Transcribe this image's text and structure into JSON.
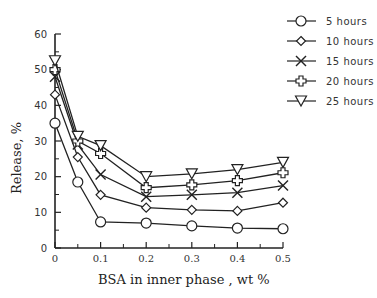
{
  "chart_data": {
    "type": "line",
    "title": "",
    "xlabel": "BSA  in inner phase , wt %",
    "ylabel": "Release,  %",
    "xlim": [
      0,
      0.5
    ],
    "ylim": [
      0,
      60
    ],
    "x_ticks": [
      0,
      0.1,
      0.2,
      0.3,
      0.4,
      0.5
    ],
    "x_tick_labels": [
      "0",
      "0.1",
      "0.2",
      "0.3",
      "0.4",
      "0.5"
    ],
    "y_ticks": [
      0,
      10,
      20,
      30,
      40,
      50,
      60
    ],
    "y_tick_labels": [
      "0",
      "10",
      "20",
      "30",
      "40",
      "50",
      "60"
    ],
    "grid": false,
    "legend_position": "upper right, outside plot",
    "x": [
      0,
      0.05,
      0.1,
      0.2,
      0.3,
      0.4,
      0.5
    ],
    "series": [
      {
        "name": "5 hours",
        "marker": "circle",
        "values": [
          35,
          18.5,
          7.3,
          7.0,
          6.2,
          5.6,
          5.4
        ]
      },
      {
        "name": "10 hours",
        "marker": "diamond",
        "values": [
          43,
          25.5,
          14.9,
          11.3,
          10.7,
          10.4,
          12.7
        ]
      },
      {
        "name": "15 hours",
        "marker": "cross",
        "values": [
          48,
          29,
          20.6,
          14.4,
          14.9,
          15.5,
          17.5
        ]
      },
      {
        "name": "20 hours",
        "marker": "plus",
        "values": [
          50,
          30,
          26.5,
          16.9,
          17.7,
          18.9,
          21.1
        ]
      },
      {
        "name": "25 hours",
        "marker": "triangle-down",
        "values": [
          52.5,
          31.3,
          28.7,
          20,
          20.8,
          22,
          24
        ]
      }
    ]
  },
  "colors": {
    "line": "#222222",
    "marker_fill": "#ffffff",
    "text": "#333333"
  }
}
